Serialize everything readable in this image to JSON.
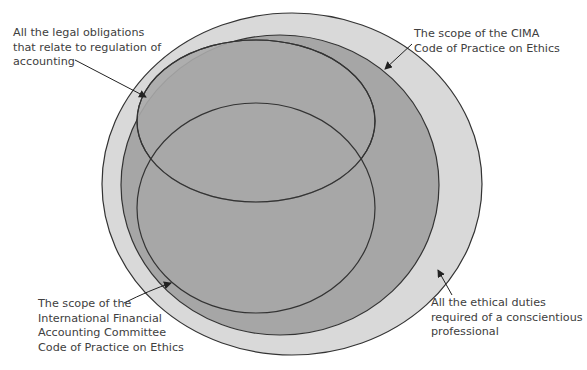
{
  "diagram": {
    "type": "nested-ellipse-venn",
    "colors": {
      "outer_fill": "#d9d9d9",
      "cima_fill": "#a6a6a6",
      "inner_fill": "#a9a9a9",
      "stroke": "#333333",
      "text": "#404040",
      "background": "#ffffff"
    },
    "regions": [
      {
        "id": "ethical-duties",
        "description": "All the ethical duties required of a conscientious professional"
      },
      {
        "id": "cima-code",
        "description": "The scope of the CIMA Code of Practice on Ethics"
      },
      {
        "id": "legal-obligations",
        "description": "All the legal obligations that relate to regulation of accounting"
      },
      {
        "id": "ifac-code",
        "description": "The scope of the International Financial Accounting Committee Code of Practice on Ethics"
      }
    ],
    "labels": {
      "legal": {
        "lines": [
          "All the legal obligations",
          "that relate to regulation of",
          "accounting"
        ]
      },
      "cima": {
        "lines": [
          "The scope of the CIMA",
          "Code of Practice on Ethics"
        ]
      },
      "ifac": {
        "lines": [
          "The scope of the",
          "International Financial",
          "Accounting Committee",
          "Code of Practice on Ethics"
        ]
      },
      "ethical": {
        "lines": [
          "All the ethical duties",
          "required of a conscientious",
          "professional"
        ]
      }
    }
  }
}
